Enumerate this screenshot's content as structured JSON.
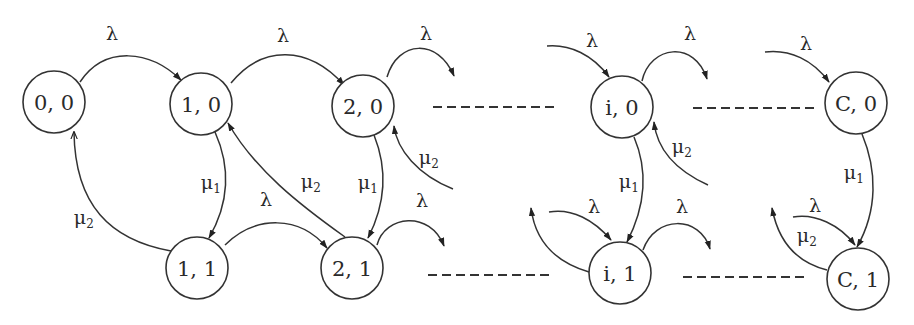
{
  "diagram": {
    "type": "state-transition-diagram",
    "nodes": [
      {
        "id": "n00",
        "label": "0, 0"
      },
      {
        "id": "n10",
        "label": "1, 0"
      },
      {
        "id": "n20",
        "label": "2, 0"
      },
      {
        "id": "ni0",
        "label": "i, 0"
      },
      {
        "id": "nC0",
        "label": "C, 0"
      },
      {
        "id": "n11",
        "label": "1, 1"
      },
      {
        "id": "n21",
        "label": "2, 1"
      },
      {
        "id": "ni1",
        "label": "i, 1"
      },
      {
        "id": "nC1",
        "label": "C, 1"
      }
    ],
    "symbols": {
      "lambda": "λ",
      "mu": "μ",
      "sub1": "1",
      "sub2": "2"
    },
    "edges": [
      {
        "from": "0, 0",
        "to": "1, 0",
        "label": "λ"
      },
      {
        "from": "1, 0",
        "to": "2, 0",
        "label": "λ"
      },
      {
        "from": "2, 0",
        "to": "…",
        "label": "λ"
      },
      {
        "from": "…",
        "to": "i, 0",
        "label": "λ"
      },
      {
        "from": "i, 0",
        "to": "…",
        "label": "λ"
      },
      {
        "from": "…",
        "to": "C, 0",
        "label": "λ"
      },
      {
        "from": "1, 0",
        "to": "1, 1",
        "label": "μ1"
      },
      {
        "from": "2, 0",
        "to": "2, 1",
        "label": "μ1"
      },
      {
        "from": "i, 0",
        "to": "i, 1",
        "label": "μ1"
      },
      {
        "from": "C, 0",
        "to": "C, 1",
        "label": "μ1"
      },
      {
        "from": "1, 1",
        "to": "0, 0",
        "label": "μ2"
      },
      {
        "from": "2, 1",
        "to": "1, 0",
        "label": "μ2"
      },
      {
        "from": "…",
        "to": "2, 0",
        "label": "μ2"
      },
      {
        "from": "…",
        "to": "i, 0",
        "label": "μ2"
      },
      {
        "from": "C, 1",
        "to": "…",
        "label": "μ2"
      },
      {
        "from": "1, 1",
        "to": "2, 1",
        "label": "λ"
      },
      {
        "from": "2, 1",
        "to": "…",
        "label": "λ"
      },
      {
        "from": "…",
        "to": "i, 1",
        "label": "λ"
      },
      {
        "from": "i, 1",
        "to": "…",
        "label": "λ"
      },
      {
        "from": "…",
        "to": "C, 1",
        "label": "λ"
      }
    ]
  }
}
